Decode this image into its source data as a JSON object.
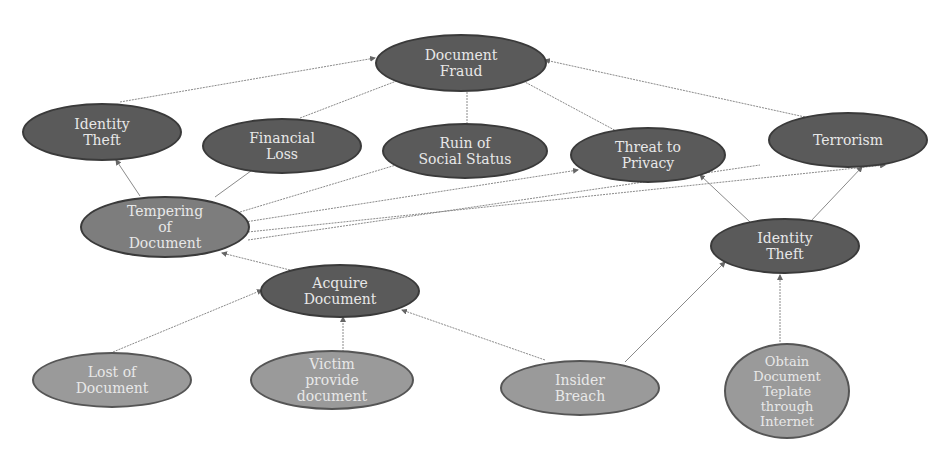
{
  "nodes": {
    "document_fraud": {
      "label": "Document\nFraud"
    },
    "identity_theft_top": {
      "label": "Identity\nTheft"
    },
    "financial_loss": {
      "label": "Financial\nLoss"
    },
    "ruin_social_status": {
      "label": "Ruin of\nSocial Status"
    },
    "threat_privacy": {
      "label": "Threat to\nPrivacy"
    },
    "terrorism": {
      "label": "Terrorism"
    },
    "tempering_document": {
      "label": "Tempering\nof\nDocument"
    },
    "identity_theft_mid": {
      "label": "Identity\nTheft"
    },
    "acquire_document": {
      "label": "Acquire\nDocument"
    },
    "lost_document": {
      "label": "Lost of\nDocument"
    },
    "victim_provide": {
      "label": "Victim\nprovide\ndocument"
    },
    "insider_breach": {
      "label": "Insider\nBreach"
    },
    "obtain_template": {
      "label": "Obtain\nDocument\nTeplate\nthrough\nInternet"
    }
  },
  "edges": [
    {
      "from": "identity_theft_top",
      "to": "document_fraud"
    },
    {
      "from": "financial_loss",
      "to": "document_fraud"
    },
    {
      "from": "ruin_social_status",
      "to": "document_fraud"
    },
    {
      "from": "threat_privacy",
      "to": "document_fraud"
    },
    {
      "from": "terrorism",
      "to": "document_fraud"
    },
    {
      "from": "tempering_document",
      "to": "identity_theft_top"
    },
    {
      "from": "tempering_document",
      "to": "financial_loss"
    },
    {
      "from": "tempering_document",
      "to": "ruin_social_status"
    },
    {
      "from": "tempering_document",
      "to": "threat_privacy"
    },
    {
      "from": "tempering_document",
      "to": "terrorism"
    },
    {
      "from": "identity_theft_mid",
      "to": "threat_privacy"
    },
    {
      "from": "identity_theft_mid",
      "to": "terrorism"
    },
    {
      "from": "acquire_document",
      "to": "tempering_document"
    },
    {
      "from": "lost_document",
      "to": "acquire_document"
    },
    {
      "from": "victim_provide",
      "to": "acquire_document"
    },
    {
      "from": "insider_breach",
      "to": "acquire_document"
    },
    {
      "from": "insider_breach",
      "to": "identity_theft_mid"
    },
    {
      "from": "obtain_template",
      "to": "identity_theft_mid"
    }
  ],
  "colors": {
    "dark_node": "#5a5a5a",
    "mid_node": "#7d7d7d",
    "light_node": "#9a9a9a",
    "edge": "#8a8a8a",
    "text": "#e8e8e8"
  }
}
